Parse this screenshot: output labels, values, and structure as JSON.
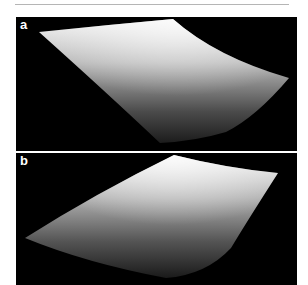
{
  "figure": {
    "panels": [
      {
        "label": "a",
        "description": "3D rendered curved surface, saddle-like, lit from top"
      },
      {
        "label": "b",
        "description": "3D rendered curved surface, lit from top"
      }
    ],
    "colors": {
      "background": "#000000",
      "surface_light": "#f2f2f2",
      "surface_dark": "#1a1a1a",
      "rule": "#b5b5b5"
    }
  }
}
